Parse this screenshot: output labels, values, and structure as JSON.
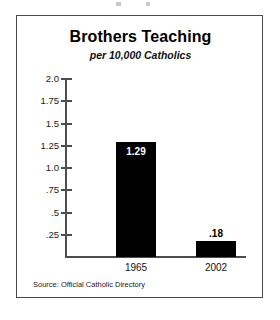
{
  "chart_data": {
    "type": "bar",
    "title": "Brothers Teaching",
    "subtitle": "per 10,000 Catholics",
    "categories": [
      "1965",
      "2002"
    ],
    "values": [
      1.29,
      0.18
    ],
    "value_labels": [
      "1.29",
      ".18"
    ],
    "xlabel": "",
    "ylabel": "",
    "ylim": [
      0,
      2.0
    ],
    "grid": false,
    "legend": null,
    "bar_color": "#000000",
    "axis_color": "#4d4d4d",
    "y_ticks": [
      {
        "value": 2.0,
        "label": "2.0"
      },
      {
        "value": 1.75,
        "label": "1.75"
      },
      {
        "value": 1.5,
        "label": "1.5"
      },
      {
        "value": 1.25,
        "label": "1.25"
      },
      {
        "value": 1.0,
        "label": "1.0"
      },
      {
        "value": 0.75,
        "label": ".75"
      },
      {
        "value": 0.5,
        "label": ".5"
      },
      {
        "value": 0.25,
        "label": ".25"
      }
    ],
    "source": "Source: Official Catholic Directory"
  }
}
